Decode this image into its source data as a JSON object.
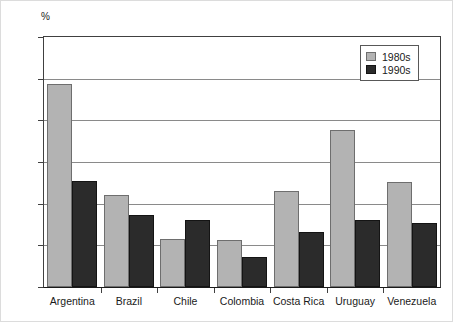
{
  "chart_data": {
    "type": "bar",
    "title": "",
    "subtitle": "",
    "xlabel": "",
    "ylabel": "%",
    "unit_label": "%",
    "ylim": [
      0,
      60
    ],
    "yticks": [
      0,
      10,
      20,
      30,
      40,
      50,
      60
    ],
    "ytick_labels": [
      "0",
      "10",
      "20",
      "30",
      "40",
      "50",
      "60"
    ],
    "grid": true,
    "grid_axis": "y",
    "legend_position": "top-right",
    "categories": [
      "Argentina",
      "Brazil",
      "Chile",
      "Colombia",
      "Costa Rica",
      "Uruguay",
      "Venezuela"
    ],
    "series": [
      {
        "name": "1980s",
        "color": "#b3b3b3",
        "edge_color": "#6e6e6e",
        "values": [
          48.7,
          22.0,
          11.5,
          11.3,
          23.0,
          37.8,
          25.3
        ]
      },
      {
        "name": "1990s",
        "color": "#2b2b2b",
        "edge_color": "#141414",
        "values": [
          25.4,
          17.3,
          16.0,
          7.1,
          13.2,
          16.1,
          15.3
        ]
      }
    ]
  },
  "legend": {
    "entries": [
      {
        "label": "1980s"
      },
      {
        "label": "1990s"
      }
    ]
  },
  "colors": {
    "series_1980s": "#b3b3b3",
    "series_1990s": "#2b2b2b",
    "gridline": "#8a8a8a",
    "axis": "#1a1a1a",
    "background": "#ffffff"
  }
}
